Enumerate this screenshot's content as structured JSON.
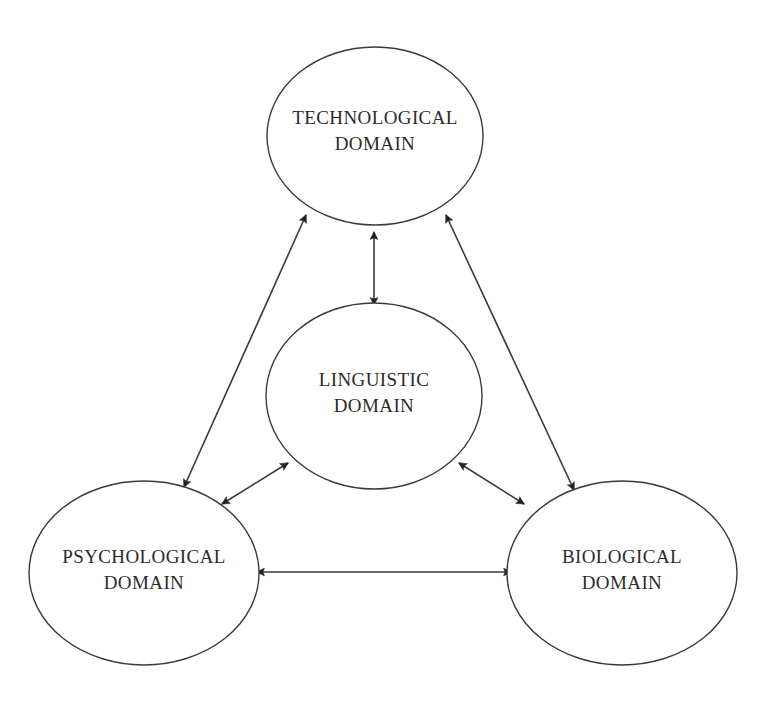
{
  "canvas": {
    "width": 767,
    "height": 705,
    "background": "#ffffff",
    "stroke_color": "#3a3a3a",
    "arrow_fill": "#222222",
    "text_color": "#2b2b2b"
  },
  "diagram": {
    "type": "node-link-diagram",
    "title": "",
    "nodes": [
      {
        "id": "technological",
        "label_line1": "TECHNOLOGICAL",
        "label_line2": "DOMAIN",
        "cx": 375,
        "cy": 136,
        "rx": 108,
        "ry": 89
      },
      {
        "id": "linguistic",
        "label_line1": "LINGUISTIC",
        "label_line2": "DOMAIN",
        "cx": 374,
        "cy": 396,
        "rx": 108,
        "ry": 93
      },
      {
        "id": "psychological",
        "label_line1": "PSYCHOLOGICAL",
        "label_line2": "DOMAIN",
        "cx": 144,
        "cy": 573,
        "rx": 115,
        "ry": 92
      },
      {
        "id": "biological",
        "label_line1": "BIOLOGICAL",
        "label_line2": "DOMAIN",
        "cx": 622,
        "cy": 573,
        "rx": 115,
        "ry": 92
      }
    ],
    "edges": [
      {
        "id": "technological-linguistic",
        "from": "technological",
        "to": "linguistic",
        "direction": "bidirectional",
        "x1": 374,
        "y1": 232,
        "x2": 374,
        "y2": 305
      },
      {
        "id": "technological-psychological",
        "from": "technological",
        "to": "psychological",
        "direction": "bidirectional",
        "x1": 306,
        "y1": 215,
        "x2": 184,
        "y2": 487
      },
      {
        "id": "technological-biological",
        "from": "technological",
        "to": "biological",
        "direction": "bidirectional",
        "x1": 446,
        "y1": 215,
        "x2": 574,
        "y2": 490
      },
      {
        "id": "linguistic-psychological",
        "from": "linguistic",
        "to": "psychological",
        "direction": "bidirectional",
        "x1": 288,
        "y1": 463,
        "x2": 222,
        "y2": 504
      },
      {
        "id": "linguistic-biological",
        "from": "linguistic",
        "to": "biological",
        "direction": "bidirectional",
        "x1": 459,
        "y1": 463,
        "x2": 524,
        "y2": 504
      },
      {
        "id": "psychological-biological",
        "from": "psychological",
        "to": "biological",
        "direction": "bidirectional",
        "x1": 257,
        "y1": 572,
        "x2": 511,
        "y2": 572
      }
    ]
  }
}
